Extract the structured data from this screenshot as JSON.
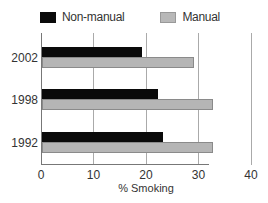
{
  "chart_data": {
    "type": "bar",
    "orientation": "horizontal",
    "title": "",
    "categories": [
      "2002",
      "1998",
      "1992"
    ],
    "series": [
      {
        "name": "Non-manual",
        "color": "#0a0a0a",
        "values": [
          19,
          22,
          23
        ]
      },
      {
        "name": "Manual",
        "color": "#b5b5b5",
        "values": [
          29,
          32.5,
          32.5
        ]
      }
    ],
    "xlabel": "% Smoking",
    "ylabel": "",
    "xlim": [
      0,
      40
    ],
    "xticks": [
      "0",
      "10",
      "20",
      "30",
      "40"
    ],
    "grid": true,
    "legend_position": "top"
  },
  "legend": {
    "items": [
      {
        "label": "Non-manual"
      },
      {
        "label": "Manual"
      }
    ]
  }
}
